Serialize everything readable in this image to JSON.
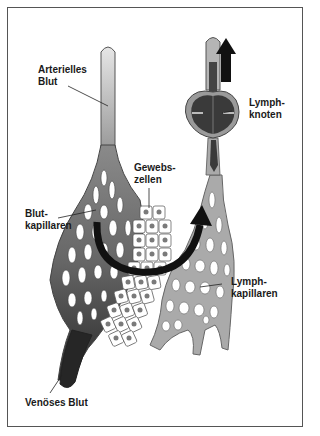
{
  "diagram": {
    "labels": {
      "arterial_blood": "Arterielles\nBlut",
      "lymph_node": "Lymph-\nknoten",
      "tissue_cells": "Gewebs-\nzellen",
      "blood_capillaries": "Blut-\nkapillaren",
      "lymph_capillaries": "Lymph-\nkapillaren",
      "venous_blood": "Venöses Blut"
    },
    "colors": {
      "arterial": "#b8b8b8",
      "capillary_blood": "#6e6e6e",
      "venous": "#2f2f2f",
      "lymph": "#a9a9a9",
      "lymph_node": "#3a3a3a",
      "arrow": "#111111",
      "cell_nucleus": "#7a7a7a"
    }
  }
}
